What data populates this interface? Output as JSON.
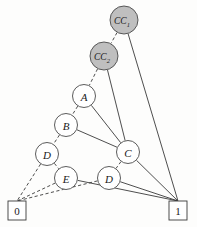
{
  "diagram": {
    "type": "binary-decision-diagram",
    "title": "",
    "style": {
      "background": "#fdfdfc",
      "shaded_node_fill": "#bfbfbf",
      "plain_node_fill": "#ffffff",
      "stroke": "#3a3a3a",
      "label_color": "#1a1a1a"
    },
    "legend": {
      "dashed_meaning": "low-edge",
      "solid_meaning": "high-edge"
    },
    "nodes": [
      {
        "id": "cc1",
        "label": "CC",
        "subscript": "1",
        "shaded": true,
        "cx": 124,
        "cy": 20,
        "r": 14
      },
      {
        "id": "cc2",
        "label": "CC",
        "subscript": "2",
        "shaded": true,
        "cx": 104,
        "cy": 56,
        "r": 14
      },
      {
        "id": "a",
        "label": "A",
        "subscript": "",
        "shaded": false,
        "cx": 84,
        "cy": 96,
        "r": 11.5
      },
      {
        "id": "b",
        "label": "B",
        "subscript": "",
        "shaded": false,
        "cx": 66,
        "cy": 125,
        "r": 11.5
      },
      {
        "id": "d1",
        "label": "D",
        "subscript": "",
        "shaded": false,
        "cx": 47,
        "cy": 154,
        "r": 11.5
      },
      {
        "id": "e",
        "label": "E",
        "subscript": "",
        "shaded": false,
        "cx": 66,
        "cy": 178,
        "r": 11.5
      },
      {
        "id": "c",
        "label": "C",
        "subscript": "",
        "shaded": false,
        "cx": 128,
        "cy": 152,
        "r": 11.5
      },
      {
        "id": "d2",
        "label": "D",
        "subscript": "",
        "shaded": false,
        "cx": 109,
        "cy": 178,
        "r": 11.5
      }
    ],
    "terminals": [
      {
        "id": "t0",
        "label": "0",
        "x": 8,
        "y": 201,
        "w": 18,
        "h": 19
      },
      {
        "id": "t1",
        "label": "1",
        "x": 169,
        "y": 201,
        "w": 18,
        "h": 19
      }
    ],
    "edges": [
      {
        "from": "cc1",
        "to": "cc2",
        "style": "dashed"
      },
      {
        "from": "cc1",
        "to": "t1",
        "style": "solid"
      },
      {
        "from": "cc2",
        "to": "a",
        "style": "dashed"
      },
      {
        "from": "cc2",
        "to": "c",
        "style": "solid"
      },
      {
        "from": "a",
        "to": "b",
        "style": "dashed"
      },
      {
        "from": "a",
        "to": "c",
        "style": "solid"
      },
      {
        "from": "b",
        "to": "d1",
        "style": "dashed"
      },
      {
        "from": "b",
        "to": "c",
        "style": "solid"
      },
      {
        "from": "d1",
        "to": "t0",
        "style": "dashed"
      },
      {
        "from": "d1",
        "to": "e",
        "style": "dashed"
      },
      {
        "from": "e",
        "to": "t0",
        "style": "dashed"
      },
      {
        "from": "e",
        "to": "t1",
        "style": "solid"
      },
      {
        "from": "c",
        "to": "d2",
        "style": "dashed"
      },
      {
        "from": "c",
        "to": "t1",
        "style": "solid"
      },
      {
        "from": "d2",
        "to": "t0",
        "style": "dashed"
      },
      {
        "from": "d2",
        "to": "t1",
        "style": "solid"
      }
    ]
  }
}
